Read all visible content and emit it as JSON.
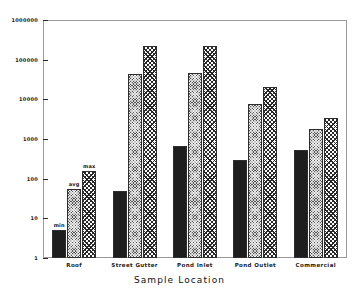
{
  "chart_data": {
    "type": "bar",
    "title": "",
    "subtitle": "",
    "xlabel": "Sample Location",
    "ylabel": "",
    "yscale": "log",
    "ylim": [
      1,
      1000000
    ],
    "grid": false,
    "legend_position": "none",
    "categories": [
      "Roof",
      "Street Gutter",
      "Pond Inlet",
      "Pond Outlet",
      "Commercial"
    ],
    "ytick_labels": [
      "1",
      "10",
      "100",
      "1000",
      "10000",
      "100000",
      "1000000"
    ],
    "ytick_values": [
      1,
      10,
      100,
      1000,
      10000,
      100000,
      1000000
    ],
    "series": [
      {
        "name": "min",
        "values": [
          5,
          50,
          700,
          300,
          550
        ]
      },
      {
        "name": "avg",
        "values": [
          55,
          45000,
          47000,
          8000,
          1900
        ]
      },
      {
        "name": "max",
        "values": [
          160,
          230000,
          235000,
          21000,
          3500
        ]
      }
    ],
    "annotations": [
      {
        "text": "min",
        "series": "min",
        "category": "Roof"
      },
      {
        "text": "avg",
        "series": "avg",
        "category": "Roof"
      },
      {
        "text": "max",
        "series": "max",
        "category": "Roof"
      }
    ],
    "colors": {
      "min": "#1e1e1e",
      "avg": "#585858",
      "max": "#ffffff",
      "outline": "#2e2e2e",
      "axis": "#9a9a9a",
      "text": "#1a1a1a",
      "background": "#ffffff"
    }
  }
}
